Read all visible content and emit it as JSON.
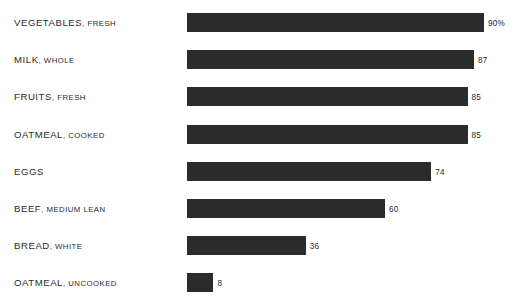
{
  "chart_data": {
    "type": "bar",
    "orientation": "horizontal",
    "title": "",
    "xlabel": "",
    "ylabel": "",
    "grid": false,
    "legend": null,
    "xlim": [
      0,
      100
    ],
    "categories": [
      "VEGETABLES, FRESH",
      "MILK, WHOLE",
      "FRUITS, FRESH",
      "OATMEAL, COOKED",
      "EGGS",
      "BEEF, MEDIUM LEAN",
      "BREAD, WHITE",
      "OATMEAL, UNCOOKED"
    ],
    "values": [
      90,
      87,
      85,
      85,
      74,
      60,
      36,
      8
    ],
    "value_labels": [
      "90%",
      "87",
      "85",
      "85",
      "74",
      "60",
      "36",
      "8"
    ],
    "bar_color": "#2b2b2b",
    "background_color": "#ffffff"
  },
  "rows": [
    {
      "main": "VEGETABLES",
      "qual": ", FRESH",
      "value": 90,
      "value_label": "90%"
    },
    {
      "main": "MILK",
      "qual": ", WHOLE",
      "value": 87,
      "value_label": "87"
    },
    {
      "main": "FRUITS",
      "qual": ", FRESH",
      "value": 85,
      "value_label": "85"
    },
    {
      "main": "OATMEAL",
      "qual": ", COOKED",
      "value": 85,
      "value_label": "85"
    },
    {
      "main": "EGGS",
      "qual": "",
      "value": 74,
      "value_label": "74"
    },
    {
      "main": "BEEF",
      "qual": ", MEDIUM LEAN",
      "value": 60,
      "value_label": "60"
    },
    {
      "main": "BREAD",
      "qual": ", WHITE",
      "value": 36,
      "value_label": "36"
    },
    {
      "main": "OATMEAL",
      "qual": ", UNCOOKED",
      "value": 8,
      "value_label": "8"
    }
  ],
  "caption": {
    "text": ""
  }
}
